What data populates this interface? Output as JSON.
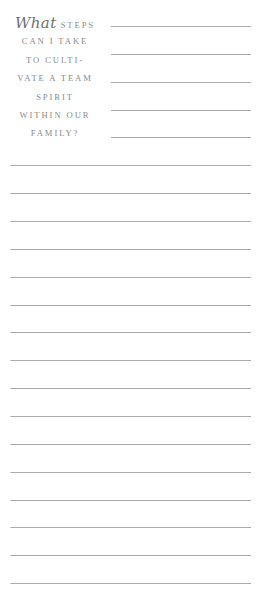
{
  "prompt": {
    "lead_word": "What",
    "lines": [
      "steps",
      "can I take",
      "to culti-",
      "vate a team",
      "spirit",
      "within our",
      "family?"
    ]
  },
  "colors": {
    "text": "#8a8a8a",
    "rule": "#a9a9a9",
    "background": "#ffffff"
  },
  "short_rules": [
    26,
    54,
    82,
    110,
    137
  ],
  "full_rules": [
    165,
    193,
    221,
    249,
    277,
    305,
    332,
    360,
    388,
    416,
    444,
    472,
    500,
    527,
    555,
    583
  ]
}
